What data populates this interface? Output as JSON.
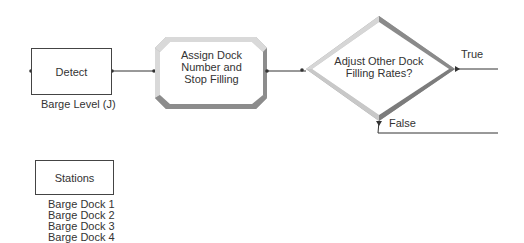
{
  "diagram": {
    "nodes": {
      "detect": {
        "label": "Detect",
        "caption": "Barge Level (J)"
      },
      "assign": {
        "label_lines": [
          "Assign Dock",
          "Number and",
          "Stop Filling"
        ]
      },
      "decide": {
        "label_lines": [
          "Adjust Other Dock",
          "Filling Rates?"
        ]
      },
      "stations": {
        "label": "Stations",
        "items": [
          "Barge Dock 1",
          "Barge Dock 2",
          "Barge Dock 3",
          "Barge Dock 4"
        ]
      }
    },
    "edges": {
      "true_label": "True",
      "false_label": "False"
    },
    "colors": {
      "line": "#333333",
      "bevel_light": "#d8d8d8",
      "bevel_dark": "#8a8a8a"
    }
  }
}
